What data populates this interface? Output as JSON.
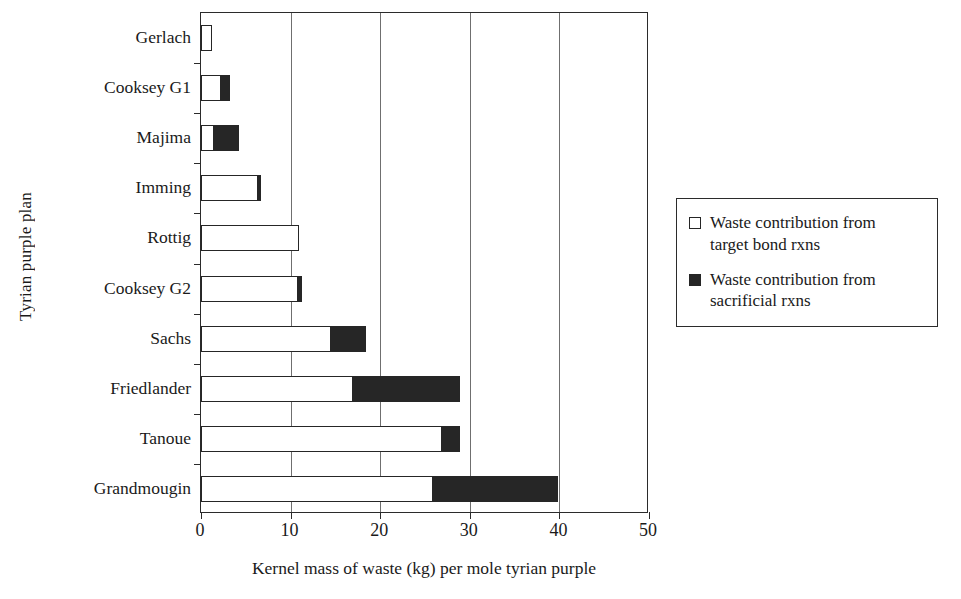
{
  "chart_data": {
    "type": "bar",
    "orientation": "horizontal",
    "stacked": true,
    "title": "",
    "xlabel": "Kernel mass of waste (kg) per mole tyrian purple",
    "ylabel": "Tyrian purple plan",
    "xlim": [
      0,
      50
    ],
    "xticks": [
      0,
      10,
      20,
      30,
      40,
      50
    ],
    "xticklabels": [
      "0",
      "10",
      "20",
      "30",
      "40",
      "50"
    ],
    "grid": "vertical gridlines at 10, 20, 30, 40",
    "legend_position": "right outside",
    "categories": [
      "Gerlach",
      "Cooksey G1",
      "Majima",
      "Imming",
      "Rottig",
      "Cooksey G2",
      "Sachs",
      "Friedlander",
      "Tanoue",
      "Grandmougin"
    ],
    "series": [
      {
        "name": "Waste contribution from target bond rxns",
        "color": "#ffffff",
        "edgecolor": "#262626",
        "values": [
          1.2,
          2.1,
          1.3,
          6.2,
          10.9,
          10.7,
          14.4,
          16.8,
          26.8,
          25.8
        ]
      },
      {
        "name": "Waste contribution from sacrificial rxns",
        "color": "#262626",
        "edgecolor": "#262626",
        "values": [
          0.0,
          1.1,
          2.9,
          0.5,
          0.0,
          0.6,
          4.0,
          12.1,
          2.1,
          14.1
        ]
      }
    ],
    "totals": [
      1.2,
      3.2,
      4.2,
      6.7,
      10.9,
      11.3,
      18.4,
      28.9,
      28.9,
      39.9
    ]
  },
  "legend": {
    "items": [
      {
        "swatch": "open-square-icon",
        "label_line1": "Waste contribution from",
        "label_line2": "target bond rxns"
      },
      {
        "swatch": "filled-square-icon",
        "label_line1": "Waste contribution from",
        "label_line2": "sacrificial rxns"
      }
    ]
  }
}
